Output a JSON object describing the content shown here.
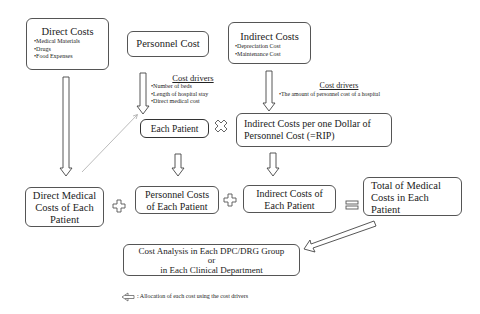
{
  "direct_costs": {
    "title": "Direct Costs",
    "items": [
      "•Medical Materials",
      "•Drugs",
      "•Food Expenses"
    ]
  },
  "personnel_cost": {
    "title": "Personnel Cost"
  },
  "indirect_costs": {
    "title": "Indirect Costs",
    "items": [
      "•Depreciation Cost",
      "•Maintenance Cost"
    ]
  },
  "cost_drivers_personnel": {
    "title": "Cost drivers",
    "items": [
      "•Number of beds",
      "•Length of hospital stay",
      "•Direct medical cost"
    ]
  },
  "cost_drivers_indirect": {
    "title": "Cost drivers",
    "items": [
      "•The amount of personnel cost of a hospital"
    ]
  },
  "each_patient": {
    "label": "Each Patient"
  },
  "rip": {
    "line1": "Indirect Costs per one Dollar of",
    "line2": "Personnel Cost (=RIP)"
  },
  "direct_medical": {
    "line1": "Direct Medical",
    "line2": "Costs of Each",
    "line3": "Patient"
  },
  "personnel_costs_patient": {
    "line1": "Personnel Costs",
    "line2": "of Each Patient"
  },
  "indirect_costs_patient": {
    "line1": "Indirect Costs of",
    "line2": "Each Patient"
  },
  "total": {
    "line1": "Total of Medical",
    "line2": "Costs in Each",
    "line3": "Patient"
  },
  "cost_analysis": {
    "line1": "Cost Analysis in Each DPC/DRG Group",
    "line2": "or",
    "line3": "in Each Clinical Department"
  },
  "legend": {
    "label": ": Allocation of each cost using the cost drivers"
  },
  "operators": {
    "multiply": "×",
    "plus": "+",
    "equals": "="
  }
}
